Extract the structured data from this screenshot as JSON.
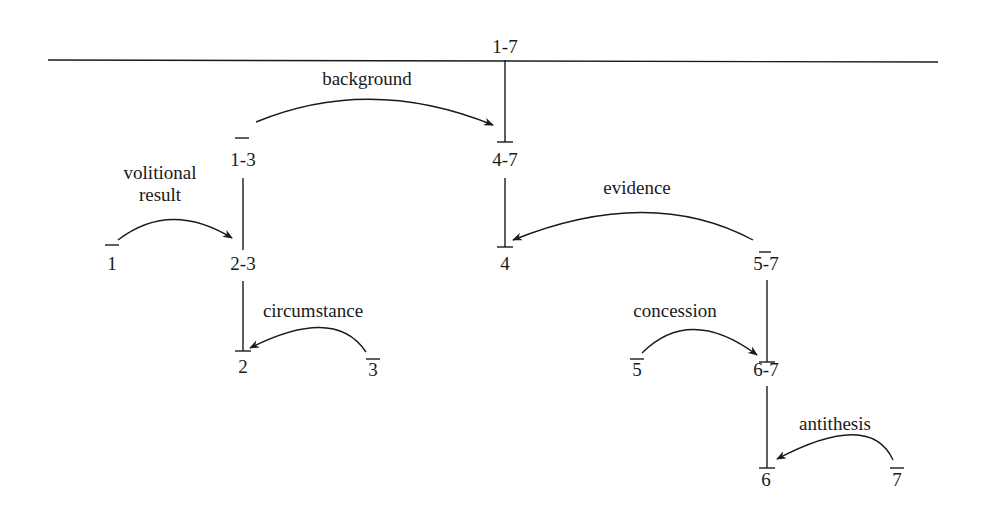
{
  "diagram": {
    "type": "rst-tree",
    "nodes": [
      {
        "id": "n17",
        "label": "1-7",
        "x": 505,
        "y": 45
      },
      {
        "id": "n13",
        "label": "1-3",
        "x": 243,
        "y": 158
      },
      {
        "id": "n47",
        "label": "4-7",
        "x": 505,
        "y": 158
      },
      {
        "id": "n1",
        "label": "1",
        "x": 112,
        "y": 262
      },
      {
        "id": "n23",
        "label": "2-3",
        "x": 243,
        "y": 262
      },
      {
        "id": "n4",
        "label": "4",
        "x": 505,
        "y": 262
      },
      {
        "id": "n57",
        "label": "5-7",
        "x": 766,
        "y": 262
      },
      {
        "id": "n2",
        "label": "2",
        "x": 243,
        "y": 365
      },
      {
        "id": "n3",
        "label": "3",
        "x": 373,
        "y": 365
      },
      {
        "id": "n5",
        "label": "5",
        "x": 636,
        "y": 365
      },
      {
        "id": "n67",
        "label": "6-7",
        "x": 766,
        "y": 365
      },
      {
        "id": "n6",
        "label": "6",
        "x": 766,
        "y": 468
      },
      {
        "id": "n7",
        "label": "7",
        "x": 896,
        "y": 468
      }
    ],
    "relations": [
      {
        "name": "background",
        "label": "background",
        "from": "1-3",
        "to": "4-7",
        "lx": 376,
        "ly": 68
      },
      {
        "name": "volitional-result",
        "label_line1": "volitional",
        "label_line2": "result",
        "from": "1",
        "to": "2-3",
        "lx": 158,
        "ly": 160
      },
      {
        "name": "evidence",
        "label": "evidence",
        "from": "5-7",
        "to": "4",
        "lx": 644,
        "ly": 177
      },
      {
        "name": "circumstance",
        "label": "circumstance",
        "from": "3",
        "to": "2",
        "lx": 312,
        "ly": 300
      },
      {
        "name": "concession",
        "label": "concession",
        "from": "5",
        "to": "6-7",
        "lx": 675,
        "ly": 300
      },
      {
        "name": "antithesis",
        "label": "antithesis",
        "from": "7",
        "to": "6",
        "lx": 836,
        "ly": 413
      }
    ]
  }
}
